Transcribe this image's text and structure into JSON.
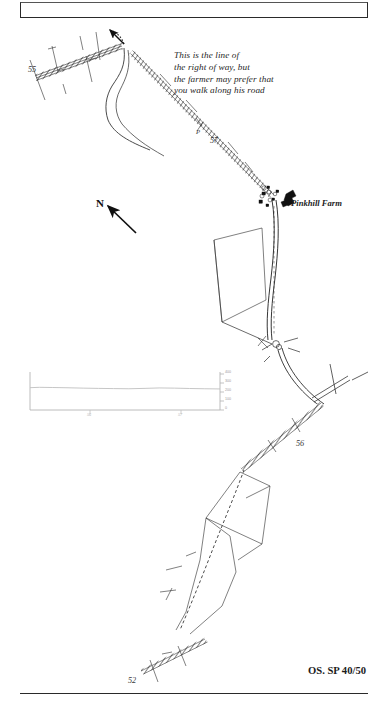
{
  "page": {
    "kind": "scanned-walk-guide-map-page",
    "background_color": "#ffffff",
    "ink_color": "#1b1b1b"
  },
  "annotations": {
    "route_note": "This is the line of\nthe right of way, but\nthe farmer may prefer that\nyou walk along his road",
    "farm_name": "Pinkhill Farm",
    "north_letter": "N",
    "os_reference": "OS. SP 40/50"
  },
  "grid_labels": [
    {
      "name": "grid-55",
      "text": "55"
    },
    {
      "name": "grid-57",
      "text": "57"
    },
    {
      "name": "grid-56",
      "text": "56"
    },
    {
      "name": "grid-52",
      "text": "52"
    },
    {
      "name": "parking-marker",
      "text": "P"
    }
  ],
  "chart_data": {
    "type": "area",
    "title": "",
    "xlabel": "",
    "ylabel": "",
    "ylim": [
      0,
      400
    ],
    "yticks": [
      0,
      100,
      200,
      300,
      400
    ],
    "ytick_labels": [
      "0",
      "100",
      "200",
      "300",
      "400"
    ],
    "xticks": [
      56,
      57
    ],
    "xtick_labels": [
      "56",
      "57"
    ],
    "grid": false,
    "legend": "none",
    "x": [
      0,
      5,
      12,
      20,
      28,
      36,
      44,
      52,
      60,
      68,
      76,
      84,
      92,
      100
    ],
    "values": [
      248,
      252,
      250,
      247,
      243,
      240,
      238,
      236,
      240,
      245,
      243,
      239,
      236,
      234
    ]
  }
}
